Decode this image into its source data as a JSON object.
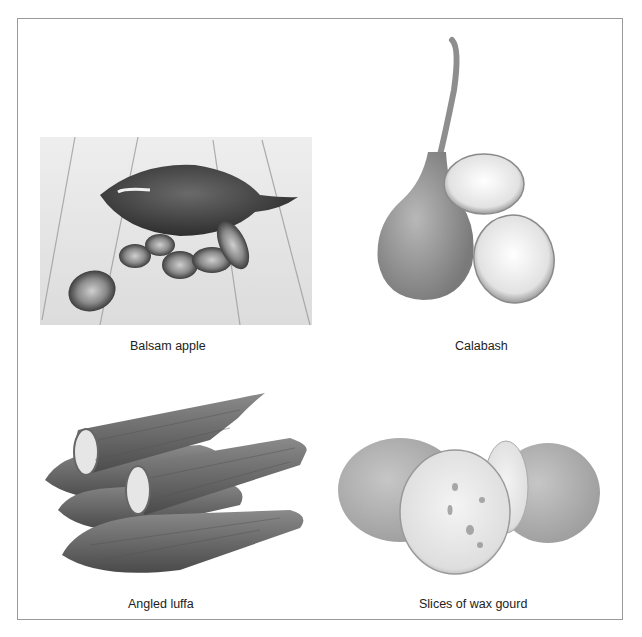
{
  "figure": {
    "panels": [
      {
        "id": "balsam-apple",
        "caption": "Balsam apple",
        "image": "balsam-apple-photo"
      },
      {
        "id": "calabash",
        "caption": "Calabash",
        "image": "calabash-photo"
      },
      {
        "id": "angled-luffa",
        "caption": "Angled luffa",
        "image": "angled-luffa-photo"
      },
      {
        "id": "wax-gourd",
        "caption": "Slices of wax gourd",
        "image": "wax-gourd-photo"
      }
    ]
  }
}
